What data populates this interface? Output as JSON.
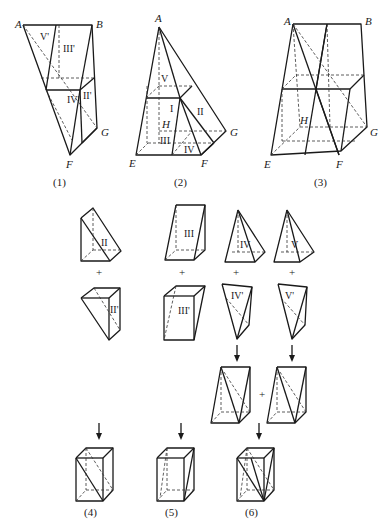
{
  "figures": {
    "fig1": {
      "caption": "(1)",
      "points": [
        "A",
        "B",
        "F",
        "G"
      ],
      "parts": [
        "V'",
        "III'",
        "IV'",
        "II'"
      ]
    },
    "fig2": {
      "caption": "(2)",
      "points": [
        "A",
        "E",
        "F",
        "G",
        "H"
      ],
      "parts": [
        "V",
        "I",
        "II",
        "III",
        "IV"
      ]
    },
    "fig3": {
      "caption": "(3)",
      "points": [
        "A",
        "B",
        "E",
        "F",
        "G",
        "H"
      ]
    },
    "fig4": {
      "caption": "(4)"
    },
    "fig5": {
      "caption": "(5)"
    },
    "fig6": {
      "caption": "(6)"
    }
  },
  "pieces": {
    "top": [
      "II",
      "III",
      "IV",
      "V"
    ],
    "bottom": [
      "II'",
      "III'",
      "IV'",
      "V'"
    ]
  },
  "operators": {
    "plus": "+",
    "arrow": "↓"
  }
}
